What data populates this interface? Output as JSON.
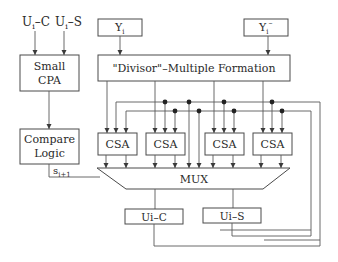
{
  "diagram": {
    "inputs": {
      "ui_c": "U",
      "ui_c_sub": "i",
      "ui_c_suffix": "–C",
      "ui_s": "U",
      "ui_s_sub": "i",
      "ui_s_suffix": "–S",
      "yi": "Y",
      "yi_sub": "i",
      "yi_neg": "Y",
      "yi_neg_sub": "i",
      "yi_neg_sup": "–"
    },
    "blocks": {
      "small_cpa_line1": "Small",
      "small_cpa_line2": "CPA",
      "compare_logic_line1": "Compare",
      "compare_logic_line2": "Logic",
      "divisor_multiple": "\"Divisor\"–Multiple Formation",
      "csa_1": "CSA",
      "csa_2": "CSA",
      "csa_3": "CSA",
      "csa_4": "CSA",
      "mux": "MUX",
      "ui_c_reg": "Ui–C",
      "ui_s_reg": "Ui–S"
    },
    "signals": {
      "s_next": "s",
      "s_next_sub": "i+1"
    },
    "colors": {
      "line": "#5a5a5a",
      "text": "#2a2a2a",
      "background": "#ffffff"
    }
  }
}
